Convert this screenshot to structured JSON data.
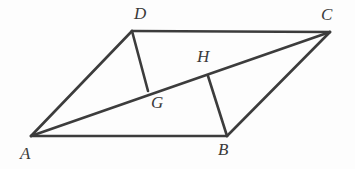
{
  "figure": {
    "kind": "geometry-diagram",
    "canvas": {
      "width": 355,
      "height": 169
    },
    "background_color": "#fdfdfd",
    "stroke_color": "#3c3c3c",
    "label_color": "#3a3a3a",
    "stroke_width": 2.6,
    "points": {
      "A": {
        "name": "A",
        "x": 31,
        "y": 136
      },
      "B": {
        "name": "B",
        "x": 227,
        "y": 136
      },
      "C": {
        "name": "C",
        "x": 330,
        "y": 32
      },
      "D": {
        "name": "D",
        "x": 132,
        "y": 31
      },
      "G": {
        "name": "G",
        "x": 148,
        "y": 91
      },
      "H": {
        "name": "H",
        "x": 208,
        "y": 76
      }
    },
    "segments": [
      {
        "name": "side-AB",
        "from": "A",
        "to": "B"
      },
      {
        "name": "side-BC",
        "from": "B",
        "to": "C"
      },
      {
        "name": "side-CD",
        "from": "C",
        "to": "D"
      },
      {
        "name": "side-DA",
        "from": "D",
        "to": "A"
      },
      {
        "name": "diagonal-AC",
        "from": "A",
        "to": "C"
      },
      {
        "name": "segment-DG",
        "from": "D",
        "to": "G"
      },
      {
        "name": "segment-BH",
        "from": "B",
        "to": "H"
      }
    ],
    "labels": [
      {
        "key": "A",
        "text": "A",
        "x": 20,
        "y": 145
      },
      {
        "key": "B",
        "text": "B",
        "x": 218,
        "y": 141
      },
      {
        "key": "C",
        "text": "C",
        "x": 321,
        "y": 6
      },
      {
        "key": "D",
        "text": "D",
        "x": 134,
        "y": 5
      },
      {
        "key": "G",
        "text": "G",
        "x": 151,
        "y": 94
      },
      {
        "key": "H",
        "text": "H",
        "x": 197,
        "y": 48
      }
    ]
  }
}
